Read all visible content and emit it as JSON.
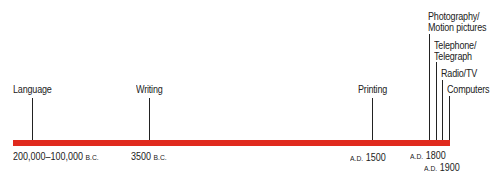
{
  "timeline": {
    "bar_color": "#e02a1e",
    "events": [
      {
        "label": "Language"
      },
      {
        "label": "Writing"
      },
      {
        "label": "Printing"
      },
      {
        "label_line1": "Photography/",
        "label_line2": "Motion pictures"
      },
      {
        "label_line1": "Telephone/",
        "label_line2": "Telegraph"
      },
      {
        "label": "Radio/TV"
      },
      {
        "label": "Computers"
      }
    ],
    "dates": [
      {
        "value": "200,000–100,000",
        "era": "B.C."
      },
      {
        "value": "3500",
        "era": "B.C."
      },
      {
        "era": "A.D.",
        "value": "1500"
      },
      {
        "era": "A.D.",
        "value": "1800"
      },
      {
        "era": "A.D.",
        "value": "1900"
      }
    ]
  }
}
